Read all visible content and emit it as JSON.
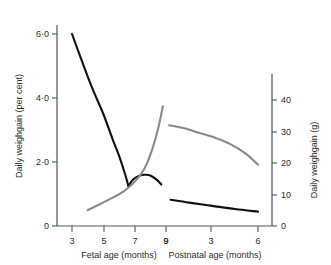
{
  "chart_data": {
    "type": "line",
    "title": "",
    "panels": [
      {
        "name": "fetal",
        "xlabel": "Fetal age (months)",
        "xticks": [
          3,
          5,
          7,
          9
        ],
        "xlim": [
          2,
          9.6
        ]
      },
      {
        "name": "postnatal",
        "xlabel": "Postnatal age (months)",
        "xticks": [
          9,
          3,
          6
        ],
        "xlim": [
          8.5,
          7.0
        ]
      }
    ],
    "axes": {
      "left": {
        "label": "Daily weighgain (per cent)",
        "ticks": [
          "6·0",
          "4·0",
          "2·0",
          "0"
        ],
        "tick_values": [
          6.0,
          4.0,
          2.0,
          0
        ],
        "ylim": [
          0,
          7.0
        ],
        "unit": "per cent"
      },
      "right": {
        "label": "Daily weighgain (g)",
        "ticks": [
          "40",
          "30",
          "20",
          "10",
          "0"
        ],
        "tick_values": [
          40,
          30,
          20,
          10,
          0
        ],
        "ylim": [
          0,
          47
        ],
        "unit": "g"
      }
    },
    "grid": false,
    "legend": "none",
    "series": [
      {
        "name": "fetal-percent",
        "color": "#111111",
        "axis": "left",
        "panel": "fetal",
        "x": [
          3.0,
          3.6,
          4.3,
          5.0,
          5.6,
          6.0,
          6.4,
          6.6
        ],
        "values": [
          6.0,
          5.2,
          4.3,
          3.5,
          2.7,
          2.2,
          1.6,
          1.25
        ]
      },
      {
        "name": "fetal-percent-hump",
        "color": "#111111",
        "axis": "left",
        "panel": "fetal",
        "x": [
          6.6,
          6.9,
          7.2,
          7.6,
          8.0,
          8.4,
          8.7
        ],
        "values": [
          1.25,
          1.45,
          1.55,
          1.6,
          1.58,
          1.45,
          1.3
        ]
      },
      {
        "name": "fetal-grams",
        "color": "#8a8a8a",
        "axis": "right",
        "panel": "fetal",
        "x": [
          4.0,
          4.8,
          5.6,
          6.3,
          7.0,
          7.6,
          8.1,
          8.5,
          8.8
        ],
        "values": [
          5.0,
          7.0,
          9.0,
          11.0,
          14.0,
          18.0,
          24.0,
          31.0,
          38.0
        ]
      },
      {
        "name": "postnatal-grams",
        "color": "#8a8a8a",
        "axis": "right",
        "panel": "postnatal",
        "x": [
          0.2,
          1.2,
          2.2,
          3.2,
          4.2,
          5.2,
          6.0
        ],
        "values": [
          32.0,
          31.0,
          29.5,
          28.0,
          26.0,
          23.0,
          19.5
        ]
      },
      {
        "name": "postnatal-percent",
        "color": "#111111",
        "axis": "left",
        "panel": "postnatal",
        "x": [
          0.3,
          1.5,
          3.0,
          4.5,
          6.0
        ],
        "values": [
          0.82,
          0.73,
          0.63,
          0.53,
          0.45
        ]
      }
    ]
  },
  "labels": {
    "left_axis_title": "Daily weighgain (per cent)",
    "right_axis_title": "Daily weighgain (g)",
    "fetal_axis_title": "Fetal age (months)",
    "postnatal_axis_title": "Postnatal age (months)",
    "left_ticks": [
      "6·0",
      "4·0",
      "2·0",
      "0"
    ],
    "right_ticks": [
      "40",
      "30",
      "20",
      "10",
      "0"
    ],
    "fetal_ticks": [
      "3",
      "5",
      "7",
      "9"
    ],
    "postnatal_ticks": [
      "9",
      "3",
      "6"
    ]
  }
}
